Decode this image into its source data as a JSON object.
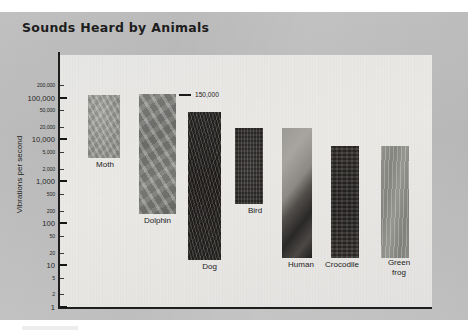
{
  "chart_title": "Sounds Heard by Animals",
  "annotation": {
    "text": "150,000",
    "icon": "leader-dash"
  },
  "y_axis": {
    "title": "Vibrations per second",
    "scale": "log",
    "ticks": [
      {
        "label": "200,000",
        "value": 200000,
        "major": false
      },
      {
        "label": "100,000",
        "value": 100000,
        "major": true
      },
      {
        "label": "50,000",
        "value": 50000,
        "major": false
      },
      {
        "label": "20,000",
        "value": 20000,
        "major": false
      },
      {
        "label": "10,000",
        "value": 10000,
        "major": true
      },
      {
        "label": "5,000",
        "value": 5000,
        "major": false
      },
      {
        "label": "2,000",
        "value": 2000,
        "major": false
      },
      {
        "label": "1,000",
        "value": 1000,
        "major": true
      },
      {
        "label": "500",
        "value": 500,
        "major": false
      },
      {
        "label": "200",
        "value": 200,
        "major": false
      },
      {
        "label": "100",
        "value": 100,
        "major": true
      },
      {
        "label": "50",
        "value": 50,
        "major": false
      },
      {
        "label": "20",
        "value": 20,
        "major": false
      },
      {
        "label": "10",
        "value": 10,
        "major": true
      },
      {
        "label": "5",
        "value": 5,
        "major": false
      },
      {
        "label": "2",
        "value": 2,
        "major": false
      },
      {
        "label": "1",
        "value": 1,
        "major": true
      }
    ]
  },
  "chart_data": {
    "type": "bar",
    "title": "Sounds Heard by Animals",
    "xlabel": "",
    "ylabel": "Vibrations per second",
    "yscale": "log",
    "ylim": [
      1,
      200000
    ],
    "grid": false,
    "legend": null,
    "categories": [
      "Moth",
      "Dolphin",
      "Dog",
      "Bird",
      "Human",
      "Crocodile",
      "Green frog"
    ],
    "values": [
      150000,
      150000,
      40000,
      25000,
      20000,
      4000,
      4000
    ],
    "ranges": [
      {
        "name": "Moth",
        "low": 3000,
        "high": 150000
      },
      {
        "name": "Dolphin",
        "low": 150,
        "high": 150000
      },
      {
        "name": "Dog",
        "low": 15,
        "high": 40000
      },
      {
        "name": "Bird",
        "low": 250,
        "high": 25000
      },
      {
        "name": "Human",
        "low": 20,
        "high": 20000
      },
      {
        "name": "Crocodile",
        "low": 20,
        "high": 4000
      },
      {
        "name": "Green frog",
        "low": 50,
        "high": 4000
      }
    ],
    "annotations": [
      {
        "text": "150,000",
        "target": "Dolphin",
        "value": 150000
      }
    ],
    "tick_labels": [
      "200,000",
      "100,000",
      "50,000",
      "20,000",
      "10,000",
      "5,000",
      "2,000",
      "1,000",
      "500",
      "200",
      "100",
      "50",
      "20",
      "10",
      "5",
      "2",
      "1"
    ]
  },
  "bars": [
    {
      "label": "Moth",
      "texture": "tex-moth",
      "left": 88,
      "top": 95,
      "width": 32,
      "height": 63,
      "label_left": 78,
      "label_top": 160
    },
    {
      "label": "Dolphin",
      "texture": "tex-dolphin",
      "left": 139,
      "top": 94,
      "width": 37,
      "height": 120,
      "label_left": 128,
      "label_top": 216
    },
    {
      "label": "Dog",
      "texture": "tex-dog",
      "left": 188,
      "top": 112,
      "width": 33,
      "height": 148,
      "label_left": 182,
      "label_top": 262
    },
    {
      "label": "Bird",
      "texture": "tex-bird",
      "left": 235,
      "top": 128,
      "width": 28,
      "height": 76,
      "label_left": 230,
      "label_top": 206
    },
    {
      "label": "Human",
      "texture": "tex-human",
      "left": 282,
      "top": 128,
      "width": 30,
      "height": 130,
      "label_left": 275,
      "label_top": 260
    },
    {
      "label": "Crocodile",
      "texture": "tex-crocodile",
      "left": 331,
      "top": 146,
      "width": 28,
      "height": 112,
      "label_left": 317,
      "label_top": 260
    },
    {
      "label": "Green frog",
      "texture": "tex-greenfrog",
      "left": 381,
      "top": 146,
      "width": 28,
      "height": 112,
      "label_left": 374,
      "label_top": 258
    }
  ]
}
